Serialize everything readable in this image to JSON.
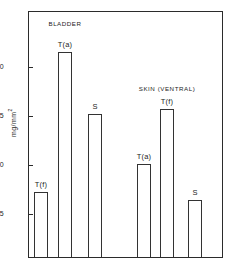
{
  "chart_data": {
    "type": "bar",
    "title": "",
    "xlabel": "",
    "ylabel": "mg/mm",
    "ylabel_sup": "2",
    "ylim": [
      0,
      23.5
    ],
    "grid": false,
    "legend": "none",
    "yticks": [
      "20",
      "15",
      "10",
      "5"
    ],
    "ytick_values": [
      20,
      15,
      10,
      5
    ],
    "groups": [
      {
        "name": "BLADDER",
        "bars": [
          {
            "label": "T(f)",
            "value": 7.2
          },
          {
            "label": "T(a)",
            "value": 21.5
          },
          {
            "label": "S",
            "value": 15.2
          }
        ]
      },
      {
        "name": "SKIN (VENTRAL)",
        "bars": [
          {
            "label": "T(a)",
            "value": 10.1
          },
          {
            "label": "T(f)",
            "value": 15.7
          },
          {
            "label": "S",
            "value": 6.4
          }
        ]
      }
    ],
    "categories": [
      "T(f)",
      "T(a)",
      "S",
      "T(a)",
      "T(f)",
      "S"
    ],
    "values": [
      7.2,
      21.5,
      15.2,
      10.1,
      15.7,
      6.4
    ],
    "bar_fill": "#ffffff",
    "bar_edge": "#333333",
    "axis_color": "#2b2b2b",
    "text_color": "#1d1d1d",
    "background": "#ffffff"
  }
}
